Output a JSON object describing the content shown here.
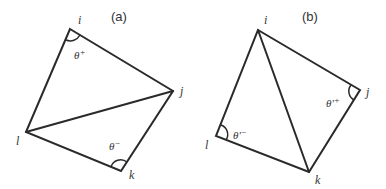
{
  "figure": {
    "panels": [
      {
        "caption": "(a)",
        "vertices": {
          "i": "i",
          "j": "j",
          "k": "k",
          "l": "l"
        },
        "diagonal": "l–j",
        "angles": [
          {
            "vertex": "i",
            "label": "θ⁺",
            "text": "θ",
            "sup": "+"
          },
          {
            "vertex": "k",
            "label": "θ⁻",
            "text": "θ",
            "sup": "−"
          }
        ]
      },
      {
        "caption": "(b)",
        "vertices": {
          "i": "i",
          "j": "j",
          "k": "k",
          "l": "l"
        },
        "diagonal": "i–k",
        "angles": [
          {
            "vertex": "j",
            "label": "θ'⁺",
            "text": "θ'",
            "sup": "+"
          },
          {
            "vertex": "l",
            "label": "θ'⁻",
            "text": "θ'",
            "sup": "−"
          }
        ]
      }
    ]
  }
}
